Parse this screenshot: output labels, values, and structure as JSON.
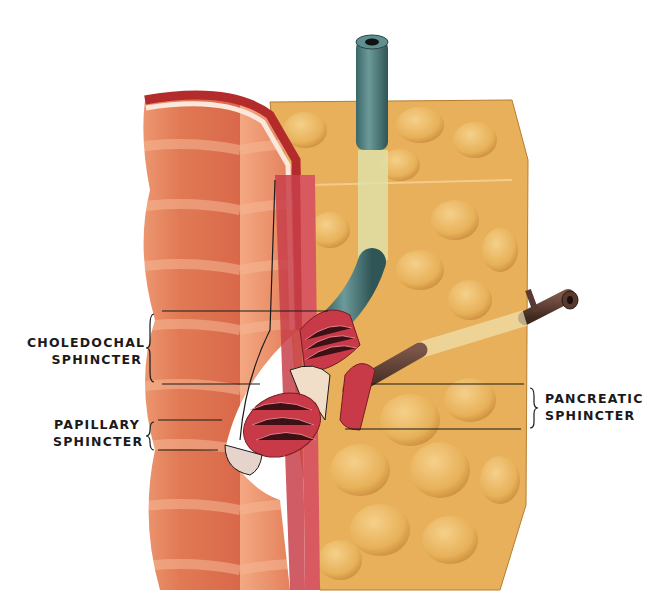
{
  "figure": {
    "labels": {
      "choledochal": {
        "line1": "CHOLEDOCHAL",
        "line2": "SPHINCTER"
      },
      "papillary": {
        "line1": "PAPILLARY",
        "line2": "SPHINCTER"
      },
      "pancreatic": {
        "line1": "PANCREATIC",
        "line2": "SPHINCTER"
      }
    },
    "structures": [
      "duodenal-wall",
      "pancreas-tissue",
      "common-bile-duct",
      "pancreatic-duct",
      "papilla"
    ],
    "colors": {
      "duodenum": "#e8825a",
      "pancreas": "#e9b55c",
      "bile_duct": "#4f7f80",
      "pancreatic_duct": "#5a3a30",
      "sphincter_muscle": "#c93a48",
      "outline": "#1a1a1a"
    }
  }
}
